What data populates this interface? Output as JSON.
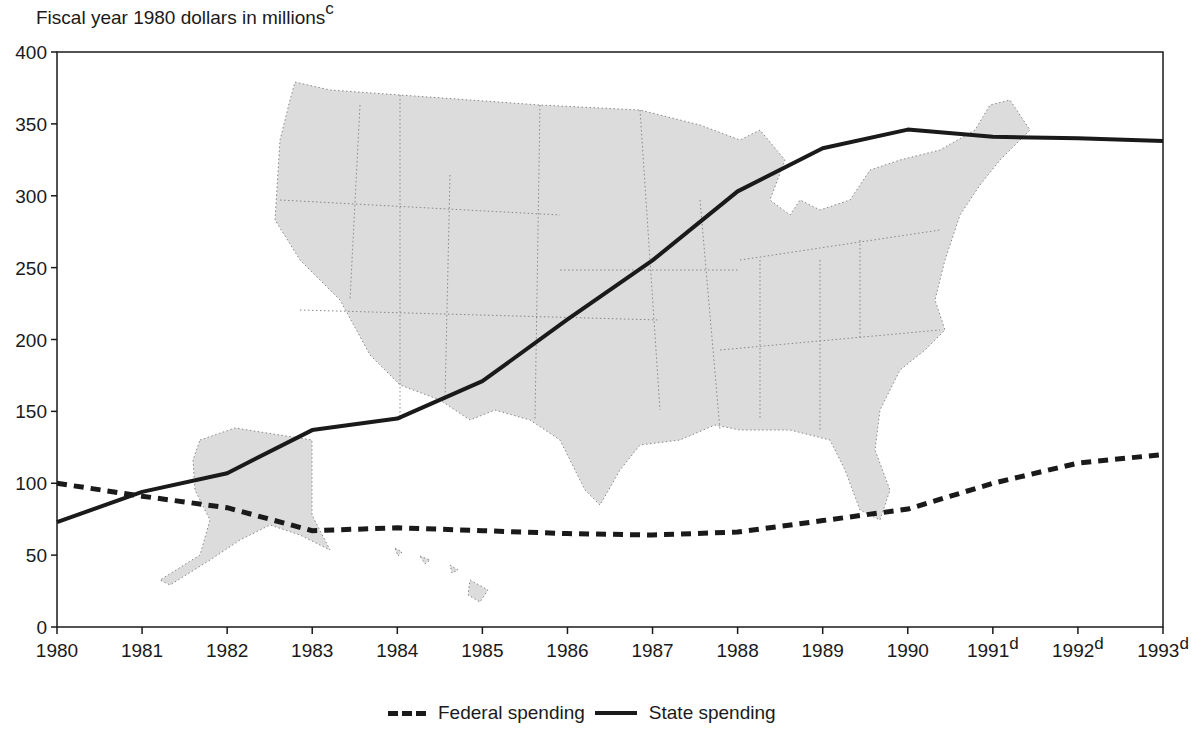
{
  "chart_data": {
    "type": "line",
    "title": "",
    "ylabel": "Fiscal year 1980 dollars in millions",
    "ylabel_footnote": "c",
    "xlabel": "",
    "ylim": [
      0,
      400
    ],
    "yticks": [
      0,
      50,
      100,
      150,
      200,
      250,
      300,
      350,
      400
    ],
    "x": [
      "1980",
      "1981",
      "1982",
      "1983",
      "1984",
      "1985",
      "1986",
      "1987",
      "1988",
      "1989",
      "1990",
      "1991",
      "1992",
      "1993"
    ],
    "x_footnotes": {
      "1991": "d",
      "1992": "d",
      "1993": "d"
    },
    "grid": false,
    "legend_position": "bottom",
    "background_image": "Map of the United States including Alaska and Hawaii (stippled)",
    "series": [
      {
        "name": "Federal spending",
        "style": "dashed",
        "values": [
          100,
          91,
          83,
          67,
          69,
          67,
          65,
          64,
          66,
          74,
          82,
          100,
          114,
          120
        ]
      },
      {
        "name": "State spending",
        "style": "solid",
        "values": [
          73,
          94,
          107,
          137,
          145,
          171,
          214,
          255,
          303,
          333,
          346,
          341,
          340,
          338
        ]
      }
    ]
  },
  "legend": {
    "federal_label": "Federal spending",
    "state_label": "State spending"
  },
  "axis": {
    "ylabel_text": "Fiscal year 1980 dollars in millions",
    "ylabel_sup": "c"
  }
}
